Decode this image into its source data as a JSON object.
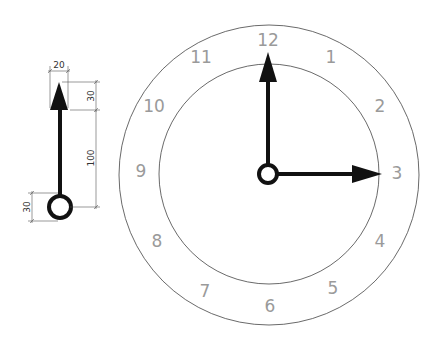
{
  "clock": {
    "center": [
      269,
      174
    ],
    "outer_radius": 150,
    "inner_radius": 110,
    "numeral_radius": 131,
    "numerals": [
      "12",
      "1",
      "2",
      "3",
      "4",
      "5",
      "6",
      "7",
      "8",
      "9",
      "10",
      "11"
    ],
    "numeral_color": "#9a9a9a",
    "hands": {
      "minute_hand_points_to": "12",
      "hour_hand_points_to": "3"
    }
  },
  "hand_drawing": {
    "dimensions": {
      "arrow_width": "20",
      "arrow_length": "30",
      "shaft_length": "100",
      "hub_diameter": "30"
    }
  }
}
